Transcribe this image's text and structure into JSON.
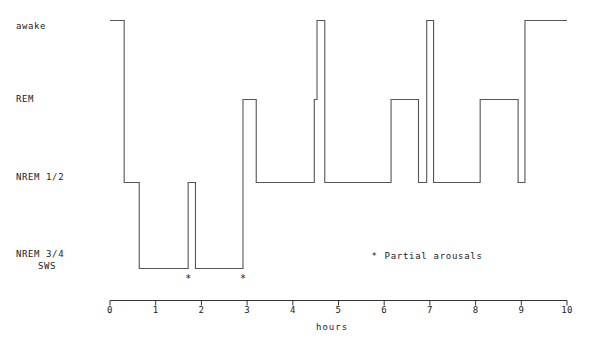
{
  "chart_data": {
    "type": "line",
    "title": "",
    "xlabel": "hours",
    "ylabel": "",
    "xlim": [
      0,
      10
    ],
    "xticks": [
      "0",
      "1",
      "2",
      "3",
      "4",
      "5",
      "6",
      "7",
      "8",
      "9",
      "10"
    ],
    "ylevels": [
      "awake",
      "REM",
      "NREM 1/2",
      "NREM 3/4\nSWS"
    ],
    "ylevel_labels": {
      "awake": "awake",
      "rem": "REM",
      "nrem12": "NREM 1/2",
      "nrem34_line1": "NREM 3/4",
      "nrem34_line2": "SWS"
    },
    "grid": false,
    "legend_position": "center-right",
    "legend": [
      {
        "marker": "*",
        "label": "Partial arousals"
      }
    ],
    "annotations": [
      {
        "marker": "*",
        "x": 1.71,
        "stage": "NREM 3/4 SWS",
        "note": "partial arousal"
      },
      {
        "marker": "*",
        "x": 2.91,
        "stage": "NREM 3/4 SWS",
        "note": "partial arousal"
      }
    ],
    "series": [
      {
        "name": "sleep stage",
        "step": "post",
        "color": "#555555",
        "segments": [
          {
            "start": 0.0,
            "end": 0.31,
            "stage": "awake"
          },
          {
            "start": 0.31,
            "end": 0.64,
            "stage": "NREM 1/2"
          },
          {
            "start": 0.64,
            "end": 1.71,
            "stage": "NREM 3/4"
          },
          {
            "start": 1.71,
            "end": 1.87,
            "stage": "NREM 1/2"
          },
          {
            "start": 1.87,
            "end": 2.91,
            "stage": "NREM 3/4"
          },
          {
            "start": 2.91,
            "end": 3.2,
            "stage": "REM"
          },
          {
            "start": 3.2,
            "end": 4.47,
            "stage": "NREM 1/2"
          },
          {
            "start": 4.47,
            "end": 4.53,
            "stage": "REM"
          },
          {
            "start": 4.53,
            "end": 4.7,
            "stage": "awake"
          },
          {
            "start": 4.7,
            "end": 6.15,
            "stage": "NREM 1/2"
          },
          {
            "start": 6.15,
            "end": 6.75,
            "stage": "REM"
          },
          {
            "start": 6.75,
            "end": 6.93,
            "stage": "NREM 1/2"
          },
          {
            "start": 6.93,
            "end": 7.08,
            "stage": "awake"
          },
          {
            "start": 7.08,
            "end": 8.1,
            "stage": "NREM 1/2"
          },
          {
            "start": 8.1,
            "end": 8.93,
            "stage": "REM"
          },
          {
            "start": 8.93,
            "end": 9.08,
            "stage": "NREM 1/2"
          },
          {
            "start": 9.08,
            "end": 10.0,
            "stage": "awake"
          }
        ]
      }
    ],
    "colors": {
      "trace": "#555555",
      "axis": "#333333",
      "text": "#1a1a1a",
      "background": "#ffffff"
    }
  }
}
